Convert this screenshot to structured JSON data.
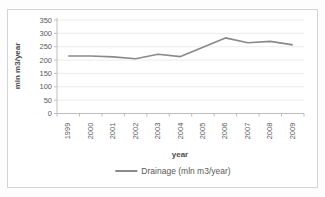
{
  "chart_data": {
    "type": "line",
    "title": "",
    "categories": [
      "1999",
      "2000",
      "2001",
      "2002",
      "2003",
      "2004",
      "2005",
      "2006",
      "2007",
      "2008",
      "2009"
    ],
    "series": [
      {
        "name": "Drainage (mln m3/year)",
        "values": [
          215,
          215,
          212,
          205,
          222,
          213,
          248,
          283,
          265,
          270,
          257
        ]
      }
    ],
    "xlabel": "year",
    "ylabel": "mln m3/year",
    "ylim": [
      0,
      350
    ],
    "yticks": [
      0,
      50,
      100,
      150,
      200,
      250,
      300,
      350
    ],
    "grid": true,
    "legend_position": "bottom"
  },
  "colors": {
    "series_line": "#8a8a8a",
    "grid_line": "#ececec",
    "axis_line": "#bdbdbd",
    "text": "#595959",
    "frame_border": "#d4d4d4",
    "background": "#ffffff"
  }
}
